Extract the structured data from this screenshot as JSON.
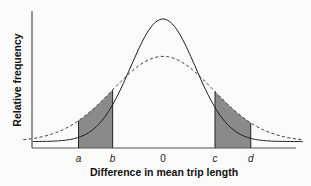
{
  "chart_data": {
    "type": "line",
    "title": "",
    "xlabel": "Difference in mean trip length",
    "ylabel": "Relative frequency",
    "xlim": [
      -4.5,
      4.5
    ],
    "ylim": [
      0,
      1.05
    ],
    "grid": false,
    "legend": null,
    "tick_labels": [
      {
        "label": "a",
        "x": -2.6
      },
      {
        "label": "b",
        "x": -1.55
      },
      {
        "label": "0",
        "x": 0
      },
      {
        "label": "c",
        "x": 1.6
      },
      {
        "label": "d",
        "x": 2.7
      }
    ],
    "series": [
      {
        "name": "narrow distribution",
        "style": "solid",
        "distribution": "normal",
        "mean": 0,
        "sd": 1.0,
        "peak": 1.0,
        "x_range": [
          -4.0,
          4.3
        ]
      },
      {
        "name": "wide distribution",
        "style": "dashed",
        "distribution": "normal",
        "mean": 0,
        "sd": 1.55,
        "peak": 0.71,
        "x_range": [
          -4.3,
          4.3
        ]
      }
    ],
    "shaded_regions": [
      {
        "from": -2.6,
        "to": -1.55,
        "between": [
          "narrow distribution",
          "wide distribution"
        ]
      },
      {
        "from": 1.6,
        "to": 2.7,
        "between": [
          "narrow distribution",
          "wide distribution"
        ]
      }
    ]
  }
}
